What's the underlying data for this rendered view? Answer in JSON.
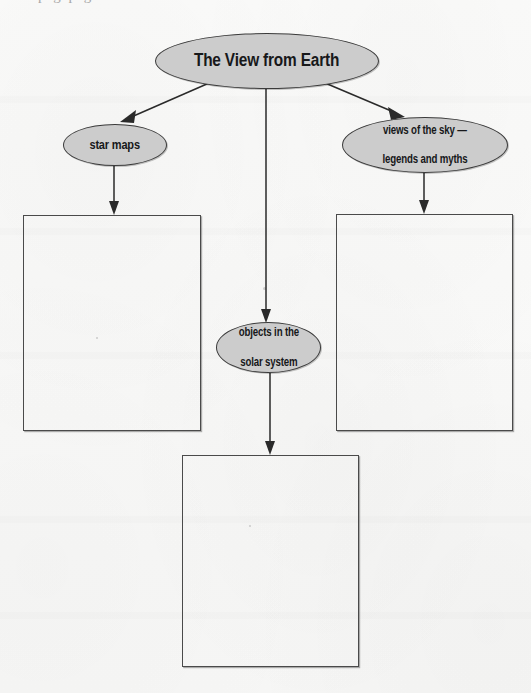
{
  "page": {
    "background_color": "#f8f8f7",
    "clipped_header_text": "p  g  p  g"
  },
  "diagram": {
    "type": "concept-map",
    "title_node": {
      "id": "root",
      "label": "The View from Earth",
      "shape": "ellipse",
      "fill_color": "#cccccc",
      "border_color": "#3b3b3b"
    },
    "nodes": [
      {
        "id": "star-maps",
        "label": "star maps",
        "shape": "ellipse",
        "fill_color": "#cccccc",
        "border_color": "#3b3b3b"
      },
      {
        "id": "objects-solar-system",
        "label_line1": "objects in the",
        "label_line2": "solar system",
        "shape": "ellipse",
        "fill_color": "#cccccc",
        "border_color": "#3b3b3b"
      },
      {
        "id": "views-of-sky",
        "label_line1": "views of the sky —",
        "label_line2": "legends and myths",
        "shape": "ellipse",
        "fill_color": "#cccccc",
        "border_color": "#3b3b3b"
      }
    ],
    "answer_boxes": [
      {
        "id": "box-star-maps",
        "value": "",
        "border_color": "#4a4a4a"
      },
      {
        "id": "box-views-of-sky",
        "value": "",
        "border_color": "#4a4a4a"
      },
      {
        "id": "box-objects-solar-system",
        "value": "",
        "border_color": "#4a4a4a"
      }
    ],
    "connectors": [
      {
        "from": "root",
        "to": "star-maps",
        "style": "arrow"
      },
      {
        "from": "root",
        "to": "objects-solar-system",
        "style": "arrow"
      },
      {
        "from": "root",
        "to": "views-of-sky",
        "style": "arrow"
      },
      {
        "from": "star-maps",
        "to": "box-star-maps",
        "style": "arrow"
      },
      {
        "from": "views-of-sky",
        "to": "box-views-of-sky",
        "style": "arrow"
      },
      {
        "from": "objects-solar-system",
        "to": "box-objects-solar-system",
        "style": "arrow"
      }
    ]
  }
}
